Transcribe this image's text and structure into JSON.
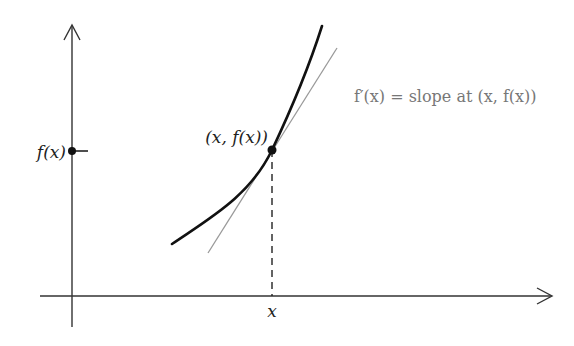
{
  "diagram": {
    "type": "derivative-tangent-illustration",
    "labels": {
      "y_axis_value": "f(x)",
      "point": "(x, f(x))",
      "tangent_annotation": "f′(x) = slope at (x, f(x))",
      "x_axis_value": "x"
    },
    "colors": {
      "axes": "#333333",
      "curve": "#111111",
      "tangent": "#999999",
      "dashed": "#222222",
      "label": "#222222",
      "annotation": "#777777"
    }
  }
}
